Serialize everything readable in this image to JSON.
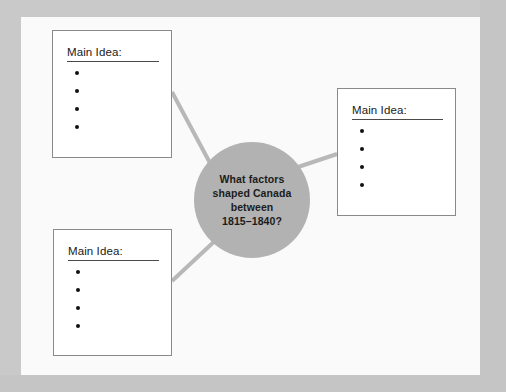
{
  "worksheet": {
    "type": "graphic-organizer",
    "title_text": "What factors shaped Canada between 1815–1840?",
    "center": {
      "question": "What factors\nshaped Canada\nbetween\n1815–1840?",
      "shape": "circle",
      "fill_color": "#b2b2b2",
      "text_color": "#1c1c1c"
    },
    "boxes": [
      {
        "id": "top-left",
        "heading": "Main Idea:",
        "bullet_count": 4,
        "bullets": [
          "",
          "",
          "",
          ""
        ]
      },
      {
        "id": "right",
        "heading": "Main Idea:",
        "bullet_count": 4,
        "bullets": [
          "",
          "",
          "",
          ""
        ]
      },
      {
        "id": "bottom-left",
        "heading": "Main Idea:",
        "bullet_count": 4,
        "bullets": [
          "",
          "",
          "",
          ""
        ]
      }
    ],
    "connectors": [
      {
        "from": "top-left",
        "to": "center"
      },
      {
        "from": "center",
        "to": "right"
      },
      {
        "from": "bottom-left",
        "to": "center"
      }
    ],
    "colors": {
      "page_background": "#fafafa",
      "outer_frame": "#c9c9c9",
      "box_border": "#8a8a8a",
      "box_fill": "#ffffff",
      "connector": "#b8b8b8",
      "bullet": "#111111",
      "rule": "#4a4a4a"
    }
  }
}
